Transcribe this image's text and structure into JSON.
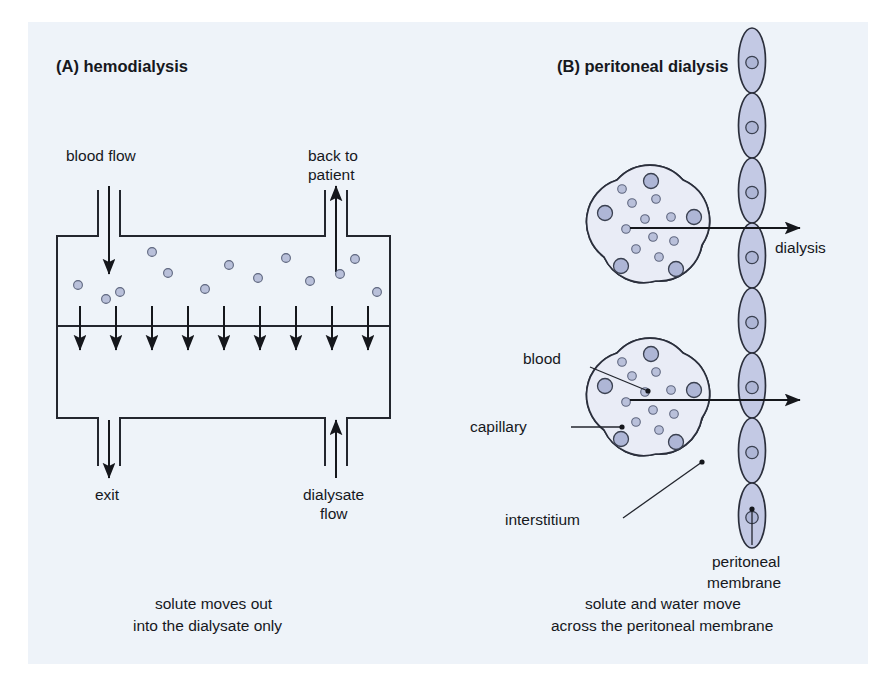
{
  "figure": {
    "background_color": "#eef3f9",
    "page_color": "#ffffff",
    "cell_fill_color": "#c3c9e4",
    "nucleus_color": "#aeb6d6",
    "line_color": "#23262e",
    "solute_color": "#b9c0da"
  },
  "panel_a": {
    "title": "(A) hemodialysis",
    "labels": {
      "blood_flow": "blood flow",
      "back_to_patient_line1": "back to",
      "back_to_patient_line2": "patient",
      "exit": "exit",
      "dialysate_flow_line1": "dialysate",
      "dialysate_flow_line2": "flow"
    },
    "caption_line1": "solute moves out",
    "caption_line2": "into the dialysate only",
    "membrane_arrow_count": 9,
    "solute_dot_count": 13,
    "solute_dots": [
      {
        "x": 78,
        "y": 285
      },
      {
        "x": 120,
        "y": 292
      },
      {
        "x": 152,
        "y": 252
      },
      {
        "x": 168,
        "y": 273
      },
      {
        "x": 205,
        "y": 289
      },
      {
        "x": 229,
        "y": 265
      },
      {
        "x": 258,
        "y": 278
      },
      {
        "x": 286,
        "y": 258
      },
      {
        "x": 310,
        "y": 281
      },
      {
        "x": 340,
        "y": 274
      },
      {
        "x": 377,
        "y": 292
      },
      {
        "x": 106,
        "y": 299
      },
      {
        "x": 355,
        "y": 259
      }
    ]
  },
  "panel_b": {
    "title": "(B) peritoneal dialysis",
    "labels": {
      "dialysis": "dialysis",
      "blood": "blood",
      "capillary": "capillary",
      "interstitium": "interstitium",
      "peritoneal_membrane_line1": "peritoneal",
      "peritoneal_membrane_line2": "membrane"
    },
    "caption_line1": "solute and water move",
    "caption_line2": "across the peritoneal membrane",
    "membrane_cell_count": 8,
    "capillary_endothelial_cell_count": 5,
    "capillaries": [
      {
        "name": "upper-capillary",
        "cx": 650,
        "cy": 225,
        "r": 56
      },
      {
        "name": "lower-capillary",
        "cx": 650,
        "cy": 398,
        "r": 56
      }
    ],
    "membrane_chain": {
      "center_x": 752,
      "top_y": 28,
      "cell_height": 65,
      "cell_width": 27
    }
  }
}
